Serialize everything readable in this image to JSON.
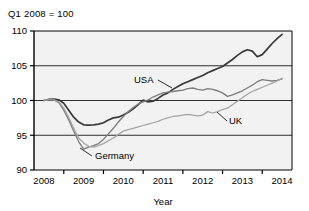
{
  "note": "Q1 2008 = 100",
  "chart_data": {
    "type": "line",
    "title": "Q1 2008 = 100",
    "xlabel": "Year",
    "ylabel": "",
    "xlim": [
      2007.75,
      2014.25
    ],
    "ylim": [
      90,
      110
    ],
    "yticks": [
      90,
      95,
      100,
      105,
      110
    ],
    "xticks": [
      2008,
      2009,
      2010,
      2011,
      2012,
      2013,
      2014
    ],
    "xtick_labels": [
      "2008",
      "2009",
      "2010",
      "2011",
      "2012",
      "2013",
      "2014"
    ],
    "ytick_labels": [
      "90",
      "95",
      "100",
      "105",
      "110"
    ],
    "grid": "horizontal",
    "legend_position": "inline-annotations",
    "annotations": [
      {
        "text": "USA",
        "value_x": 2010.9,
        "value_y": 102.6
      },
      {
        "text": "Germany",
        "value_x": 2009.35,
        "value_y": 92.3
      },
      {
        "text": "UK",
        "value_x": 2013.0,
        "value_y": 97.9
      }
    ],
    "series": [
      {
        "name": "USA",
        "color": "#3a3a3a",
        "x": [
          2008.0,
          2008.125,
          2008.25,
          2008.375,
          2008.5,
          2008.625,
          2008.75,
          2008.875,
          2009.0,
          2009.125,
          2009.25,
          2009.375,
          2009.5,
          2009.625,
          2009.75,
          2009.875,
          2010.0,
          2010.125,
          2010.25,
          2010.375,
          2010.5,
          2010.625,
          2010.75,
          2010.875,
          2011.0,
          2011.125,
          2011.25,
          2011.375,
          2011.5,
          2011.625,
          2011.75,
          2011.875,
          2012.0,
          2012.125,
          2012.25,
          2012.375,
          2012.5,
          2012.625,
          2012.75,
          2012.875,
          2013.0,
          2013.125,
          2013.25,
          2013.375,
          2013.5,
          2013.625,
          2013.75,
          2013.875,
          2014.0
        ],
        "y": [
          100.0,
          100.15,
          100.2,
          100.1,
          99.6,
          98.6,
          97.6,
          96.9,
          96.5,
          96.45,
          96.5,
          96.6,
          96.8,
          97.2,
          97.5,
          97.6,
          97.9,
          98.3,
          98.8,
          99.4,
          100.05,
          99.8,
          99.9,
          100.3,
          100.8,
          101.1,
          101.6,
          102.0,
          102.4,
          102.7,
          103.0,
          103.3,
          103.6,
          104.0,
          104.3,
          104.6,
          104.9,
          105.4,
          105.9,
          106.5,
          107.0,
          107.3,
          107.1,
          106.3,
          106.6,
          107.4,
          108.2,
          108.9,
          109.5
        ]
      },
      {
        "name": "Germany",
        "color": "#7d7d7d",
        "x": [
          2008.0,
          2008.125,
          2008.25,
          2008.375,
          2008.5,
          2008.625,
          2008.75,
          2008.875,
          2009.0,
          2009.125,
          2009.25,
          2009.375,
          2009.5,
          2009.625,
          2009.75,
          2009.875,
          2010.0,
          2010.125,
          2010.25,
          2010.375,
          2010.5,
          2010.625,
          2010.75,
          2010.875,
          2011.0,
          2011.125,
          2011.25,
          2011.375,
          2011.5,
          2011.625,
          2011.75,
          2011.875,
          2012.0,
          2012.125,
          2012.25,
          2012.375,
          2012.5,
          2012.625,
          2012.75,
          2012.875,
          2013.0,
          2013.125,
          2013.25,
          2013.375,
          2013.5,
          2013.625,
          2013.75,
          2013.875,
          2014.0
        ],
        "y": [
          100.0,
          100.2,
          100.1,
          99.7,
          98.6,
          97.2,
          95.6,
          94.1,
          93.0,
          93.3,
          93.5,
          93.8,
          94.4,
          95.2,
          96.0,
          96.9,
          97.7,
          98.4,
          99.0,
          99.5,
          99.8,
          100.1,
          100.5,
          100.8,
          101.1,
          101.2,
          101.3,
          101.4,
          101.5,
          101.7,
          101.8,
          101.6,
          101.5,
          101.7,
          101.6,
          101.4,
          101.1,
          100.6,
          100.8,
          101.1,
          101.4,
          101.8,
          102.2,
          102.7,
          103.0,
          102.9,
          102.8,
          102.9,
          103.1
        ]
      },
      {
        "name": "UK",
        "color": "#a3a3a3",
        "x": [
          2008.0,
          2008.125,
          2008.25,
          2008.375,
          2008.5,
          2008.625,
          2008.75,
          2008.875,
          2009.0,
          2009.125,
          2009.25,
          2009.375,
          2009.5,
          2009.625,
          2009.75,
          2009.875,
          2010.0,
          2010.125,
          2010.25,
          2010.375,
          2010.5,
          2010.625,
          2010.75,
          2010.875,
          2011.0,
          2011.125,
          2011.25,
          2011.375,
          2011.5,
          2011.625,
          2011.75,
          2011.875,
          2012.0,
          2012.125,
          2012.25,
          2012.375,
          2012.5,
          2012.625,
          2012.75,
          2012.875,
          2013.0,
          2013.125,
          2013.25,
          2013.375,
          2013.5,
          2013.625,
          2013.75,
          2013.875,
          2014.0
        ],
        "y": [
          100.0,
          100.1,
          100.1,
          99.8,
          98.9,
          97.6,
          96.0,
          94.6,
          93.9,
          93.4,
          93.3,
          93.5,
          93.8,
          94.2,
          94.6,
          95.1,
          95.6,
          95.8,
          96.0,
          96.2,
          96.4,
          96.6,
          96.8,
          97.0,
          97.3,
          97.5,
          97.7,
          97.8,
          97.9,
          98.0,
          97.9,
          97.8,
          97.9,
          98.4,
          98.2,
          98.4,
          98.7,
          98.9,
          99.4,
          99.9,
          100.4,
          100.9,
          101.3,
          101.6,
          101.9,
          102.2,
          102.5,
          102.8,
          103.2
        ]
      }
    ]
  }
}
